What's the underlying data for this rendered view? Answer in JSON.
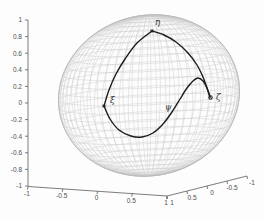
{
  "figure": {
    "width": 264,
    "height": 218,
    "background": "#fdfdfd"
  },
  "chart_data": {
    "type": "line",
    "subtype": "3d-wireframe-sphere-with-curves",
    "title": "",
    "xlabel": "",
    "ylabel": "",
    "zlabel": "",
    "grid": true,
    "legend": null,
    "view": {
      "projection": "orthographic",
      "style": "matlab-default-3d"
    },
    "axes": {
      "z": {
        "range": [
          -1,
          1
        ],
        "ticks": [
          "1",
          "0.8",
          "0.6",
          "0.4",
          "0.2",
          "0",
          "-0.2",
          "-0.4",
          "-0.6",
          "-0.8",
          "-1"
        ],
        "line_px": [
          [
            28,
            20
          ],
          [
            28,
            186
          ]
        ]
      },
      "x": {
        "range": [
          -1,
          1
        ],
        "ticks": [
          "-1",
          "-0.5",
          "0",
          "0.5",
          "1"
        ],
        "line_px": [
          [
            28,
            186.5
          ],
          [
            167,
            196
          ]
        ]
      },
      "y": {
        "range": [
          -1,
          1
        ],
        "ticks": [
          "1",
          "0.5",
          "0",
          "-0.5",
          "-1"
        ],
        "line_px": [
          [
            167,
            196
          ],
          [
            247,
            176
          ]
        ]
      }
    },
    "sphere": {
      "radius": 1,
      "center_px": [
        149,
        95.5
      ],
      "basis_px": {
        "ex": [
          66,
          3
        ],
        "ey": [
          -62,
          10
        ],
        "ez": [
          0,
          -80
        ]
      },
      "meridian_step_deg": 6,
      "parallel_step_deg": 6,
      "sample_step_deg": 3,
      "mesh_color": "#cccccc",
      "outline_color": "#b4b4b4",
      "mesh_width": 0.45,
      "outline_width": 0.8
    },
    "curves": [
      {
        "name": "arc-xi-eta",
        "color": "#1c1c1c",
        "width": 1.4,
        "points_px": [
          [
            104,
            106
          ],
          [
            109,
            90
          ],
          [
            116,
            74
          ],
          [
            125,
            59
          ],
          [
            137,
            43
          ],
          [
            152,
            31
          ]
        ]
      },
      {
        "name": "arc-eta-zeta",
        "color": "#1c1c1c",
        "width": 1.4,
        "points_px": [
          [
            152,
            31
          ],
          [
            164,
            35
          ],
          [
            176,
            42
          ],
          [
            188,
            53
          ],
          [
            197,
            65
          ],
          [
            203,
            77
          ],
          [
            207,
            88
          ],
          [
            210,
            97
          ]
        ]
      },
      {
        "name": "curve-psi",
        "color": "#1c1c1c",
        "width": 1.4,
        "points_px": [
          [
            104,
            106
          ],
          [
            110,
            119
          ],
          [
            119,
            130
          ],
          [
            131,
            136
          ],
          [
            142,
            137
          ],
          [
            153,
            133
          ],
          [
            163,
            124
          ],
          [
            172,
            112
          ],
          [
            180,
            99
          ],
          [
            187,
            88
          ],
          [
            193,
            81
          ],
          [
            198,
            78
          ],
          [
            203,
            81
          ],
          [
            207,
            88
          ],
          [
            210,
            97
          ]
        ]
      }
    ],
    "points": [
      {
        "id": "xi",
        "label": "ξ",
        "marker": "square",
        "marker_px": [
          104,
          106
        ],
        "label_px": [
          110,
          103
        ]
      },
      {
        "id": "eta",
        "label": "η",
        "marker": "square",
        "marker_px": [
          152,
          31
        ],
        "label_px": [
          155,
          25
        ]
      },
      {
        "id": "zeta",
        "label": "ζ",
        "marker": "circle",
        "marker_px": [
          210.5,
          97.5
        ],
        "label_px": [
          216,
          100
        ]
      },
      {
        "id": "psi",
        "label": "ψ",
        "marker": "none",
        "marker_px": null,
        "label_px": [
          165,
          110
        ]
      }
    ],
    "style": {
      "axis_color": "#5a5a5a",
      "axis_width": 0.8,
      "tick_len": 3,
      "tick_label_color": "#4f4f4f",
      "curve_color": "#1c1c1c",
      "marker_color": "#222222",
      "greek_label_color": "#2e2e2e"
    }
  }
}
